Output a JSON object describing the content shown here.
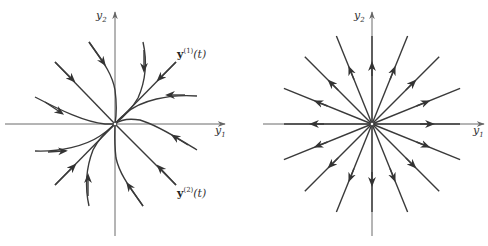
{
  "figure": {
    "left_panel": {
      "title": "Improper node (repeated eigenvalue, one eigenvector)",
      "axes": {
        "x_label": "y",
        "x_sub": "1",
        "y_label": "y",
        "y_sub": "2"
      },
      "labels": [
        {
          "vec": "y",
          "sup": "(1)",
          "arg": "(t)"
        },
        {
          "vec": "y",
          "sup": "(2)",
          "arg": "(t)"
        }
      ],
      "flow_direction": "toward origin"
    },
    "right_panel": {
      "title": "Proper node (star)",
      "axes": {
        "x_label": "y",
        "x_sub": "1",
        "y_label": "y",
        "y_sub": "2"
      },
      "ray_count": 16,
      "flow_direction": "away from origin"
    },
    "colors": {
      "trajectory": "#3a3a3a",
      "axis": "#6a6a6a",
      "background": "#ffffff"
    }
  }
}
